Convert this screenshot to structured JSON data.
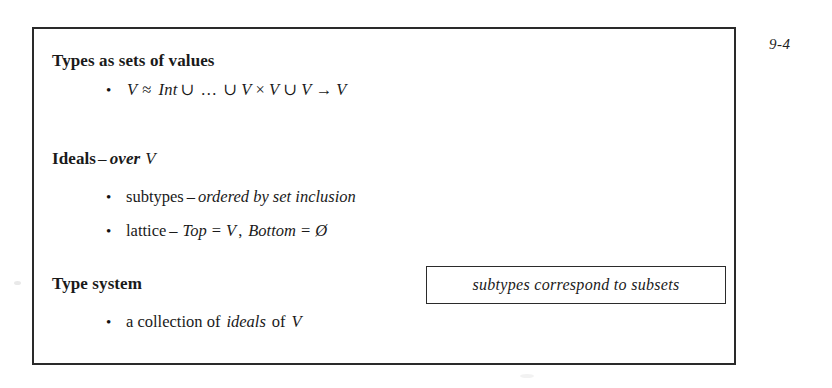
{
  "slide": {
    "page_number": "9-4",
    "sections": [
      {
        "id": "types-as-sets",
        "heading": "Types as sets of values",
        "bullets": [
          {
            "id": "value-domain-equation",
            "glyph": "•",
            "parts": {
              "v1": "V",
              "approx": "≈",
              "int": "Int",
              "union1": "∪",
              "ellipsis": "…",
              "union2": "∪",
              "v2": "V",
              "times": "×",
              "v3": "V",
              "union3": "∪",
              "v4": "V",
              "arrow": "→",
              "v5": "V"
            },
            "plain": "V ≈ Int ∪ … ∪ V × V ∪ V → V"
          }
        ]
      },
      {
        "id": "ideals",
        "heading": "Ideals",
        "heading_dash": "–",
        "heading_italic": "over",
        "heading_var": "V",
        "bullets": [
          {
            "id": "subtypes-ordered",
            "glyph": "•",
            "lead": "subtypes",
            "dash": "–",
            "emphasis": "ordered by set inclusion"
          },
          {
            "id": "lattice-top-bottom",
            "glyph": "•",
            "lead": "lattice",
            "dash": "–",
            "top_label": "Top",
            "eq1": "=",
            "top_value": "V",
            "comma": ",",
            "bottom_label": "Bottom",
            "eq2": "=",
            "bottom_value": "Ø"
          }
        ]
      },
      {
        "id": "type-system",
        "heading": "Type system",
        "bullets": [
          {
            "id": "collection-of-ideals",
            "glyph": "•",
            "lead": "a collection of",
            "emphasis": "ideals",
            "mid": "of",
            "var": "V"
          }
        ]
      }
    ],
    "callout": {
      "id": "subtypes-subsets-callout",
      "text": "subtypes correspond to subsets"
    }
  }
}
